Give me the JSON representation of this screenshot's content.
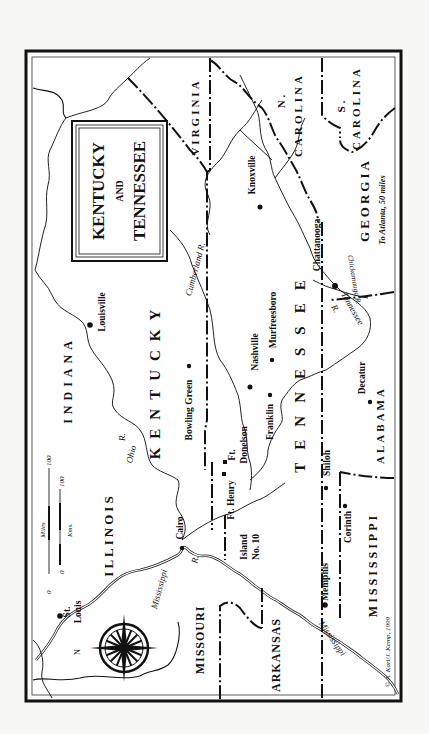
{
  "title": {
    "line1": "KENTUCKY",
    "line2": "AND",
    "line3": "TENNESSEE"
  },
  "states": {
    "virginia": "VIRGINIA",
    "n_carolina_abbr": "N.",
    "n_carolina": "CAROLINA",
    "s_carolina_abbr": "S.",
    "s_carolina": "CAROLINA",
    "georgia": "GEORGIA",
    "alabama": "ALABAMA",
    "mississippi": "MISSISSIPPI",
    "arkansas": "ARKANSAS",
    "missouri": "MISSOURI",
    "illinois": "ILLINOIS",
    "indiana": "INDIANA",
    "kentucky": "KENTUCKY",
    "tennessee": "TENNESSEE"
  },
  "cities": {
    "louisville": "Louisville",
    "bowling_green": "Bowling Green",
    "nashville": "Nashville",
    "murfreesboro": "Murfreesboro",
    "franklin": "Franklin",
    "knoxville": "Knoxville",
    "chattanooga": "Chattanooga",
    "decatur": "Decatur",
    "shiloh": "Shiloh",
    "corinth": "Corinth",
    "memphis": "Memphis",
    "cairo": "Cairo",
    "st_louis_1": "St.",
    "st_louis_2": "Louis",
    "ft_donelson_1": "Ft.",
    "ft_donelson_2": "Donelson",
    "ft_henry": "Ft. Henry",
    "island_no10_1": "Island",
    "island_no10_2": "No. 10"
  },
  "rivers": {
    "ohio": "Ohio",
    "ohio_r": "R.",
    "cumberland": "Cumberland R.",
    "tennessee": "Tennessee",
    "tennessee_r": "R.",
    "chickamauga": "Chickamauga R.",
    "mississippi_upper": "Mississippi",
    "mississippi_upper_r": "R.",
    "mississippi_lower": "Mississippi",
    "mississippi_lower_r": "R."
  },
  "annotations": {
    "atlanta": "To Atlanta, 50 miles",
    "credit": "© A. Karl/J. Kemp, 1999",
    "compass_n": "N"
  },
  "scale": {
    "miles_label": "Miles",
    "kms_label": "Kms.",
    "miles_zero": "0",
    "miles_max": "100",
    "kms_zero": "0",
    "kms_max": "100"
  },
  "colors": {
    "ink": "#111111",
    "paper": "#ffffff",
    "background": "#f7f7f5"
  }
}
